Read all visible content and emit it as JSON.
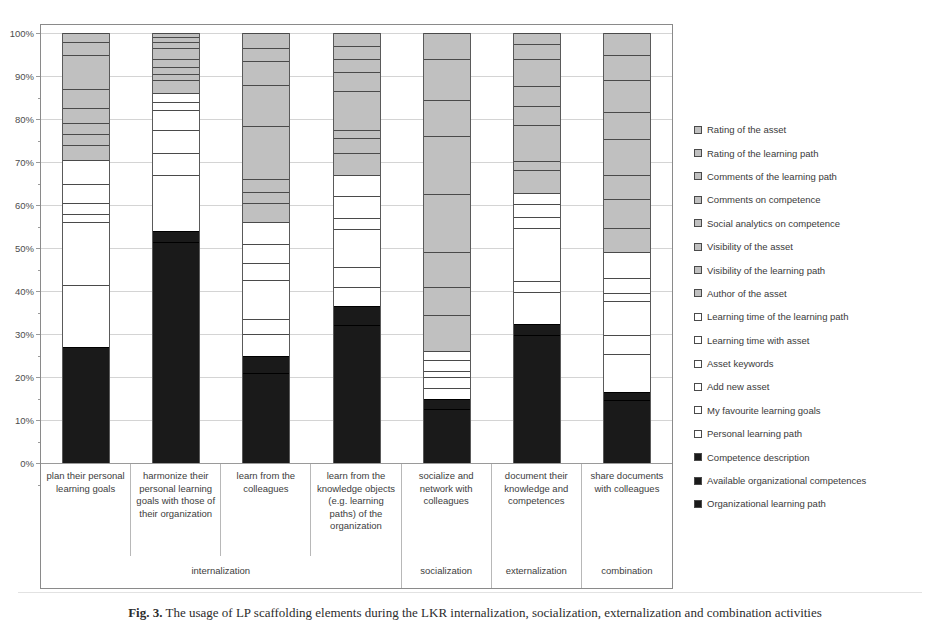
{
  "figure": {
    "caption_label": "Fig. 3.",
    "caption_text": "The usage of LP scaffolding elements during the LKR internalization, socialization, externalization and combination activities"
  },
  "chart_data": {
    "type": "bar",
    "stacked": true,
    "normalized": true,
    "title": "",
    "xlabel": "",
    "ylabel": "",
    "ylim": [
      0,
      100
    ],
    "yticks": [
      "0%",
      "10%",
      "20%",
      "30%",
      "40%",
      "50%",
      "60%",
      "70%",
      "80%",
      "90%",
      "100%"
    ],
    "grid": true,
    "legend_position": "right",
    "categories": [
      "plan their personal learning goals",
      "harmonize their personal learning goals with those of their organization",
      "learn from the colleagues",
      "learn from the knowledge objects (e.g. learning paths) of the organization",
      "socialize and network with colleagues",
      "document their knowledge and competences",
      "share documents with colleagues"
    ],
    "groups": [
      {
        "label": "internalization",
        "span": 4
      },
      {
        "label": "socialization",
        "span": 1
      },
      {
        "label": "externalization",
        "span": 1
      },
      {
        "label": "combination",
        "span": 1
      }
    ],
    "series": [
      {
        "name": "Organizational learning path",
        "fill": "dark",
        "values": [
          17.0,
          30.0,
          12.5,
          10.0,
          7.5,
          19.5,
          9.5
        ]
      },
      {
        "name": "Available organizational competences",
        "fill": "dark",
        "values": [
          10.0,
          21.5,
          8.5,
          22.0,
          5.0,
          10.5,
          6.0
        ]
      },
      {
        "name": "Competence description",
        "fill": "dark",
        "values": [
          0.0,
          2.5,
          4.0,
          4.5,
          2.5,
          2.5,
          2.0
        ]
      },
      {
        "name": "Personal learning path",
        "fill": "white",
        "values": [
          14.5,
          13.0,
          5.0,
          4.5,
          2.5,
          7.5,
          9.5
        ]
      },
      {
        "name": "My favourite learning goals",
        "fill": "white",
        "values": [
          14.5,
          5.0,
          3.5,
          4.5,
          2.5,
          2.5,
          4.5
        ]
      },
      {
        "name": "Add new asset",
        "fill": "white",
        "values": [
          2.0,
          5.5,
          9.0,
          9.0,
          0.0,
          12.5,
          8.5
        ]
      },
      {
        "name": "Asset keywords",
        "fill": "white",
        "values": [
          2.5,
          4.5,
          4.0,
          2.5,
          1.5,
          2.5,
          2.0
        ]
      },
      {
        "name": "Learning time with asset",
        "fill": "white",
        "values": [
          4.5,
          2.0,
          4.5,
          5.0,
          2.5,
          3.0,
          3.5
        ]
      },
      {
        "name": "Learning time of the learning path",
        "fill": "white",
        "values": [
          5.5,
          2.0,
          5.0,
          5.0,
          2.0,
          2.5,
          6.5
        ]
      },
      {
        "name": "Author of the asset",
        "fill": "gray",
        "values": [
          3.5,
          3.0,
          4.5,
          5.0,
          8.5,
          5.5,
          6.0
        ]
      },
      {
        "name": "Visibility of the learning path",
        "fill": "gray",
        "values": [
          2.5,
          1.5,
          2.5,
          3.5,
          6.5,
          2.0,
          7.0
        ]
      },
      {
        "name": "Visibility of the asset",
        "fill": "gray",
        "values": [
          2.5,
          1.5,
          3.0,
          2.0,
          8.0,
          8.5,
          6.0
        ]
      },
      {
        "name": "Social analytics on competence",
        "fill": "gray",
        "values": [
          3.5,
          2.0,
          12.5,
          9.0,
          13.5,
          4.5,
          9.0
        ]
      },
      {
        "name": "Comments on competence",
        "fill": "gray",
        "values": [
          4.5,
          2.5,
          9.5,
          4.5,
          13.5,
          4.5,
          6.5
        ]
      },
      {
        "name": "Comments of the learning path",
        "fill": "gray",
        "values": [
          8.0,
          1.5,
          5.5,
          3.0,
          8.5,
          6.5,
          8.0
        ]
      },
      {
        "name": "Rating of the learning path",
        "fill": "gray",
        "values": [
          3.0,
          1.0,
          3.0,
          3.0,
          9.5,
          3.5,
          6.0
        ]
      },
      {
        "name": "Rating of the asset",
        "fill": "gray",
        "values": [
          2.0,
          1.0,
          3.5,
          3.0,
          6.0,
          2.5,
          5.5
        ]
      }
    ]
  },
  "legend": {
    "items": [
      {
        "label": "Rating of the asset",
        "fill": "gray"
      },
      {
        "label": "Rating of the learning path",
        "fill": "gray"
      },
      {
        "label": "Comments of the learning path",
        "fill": "gray"
      },
      {
        "label": "Comments on competence",
        "fill": "gray"
      },
      {
        "label": "Social analytics on competence",
        "fill": "gray"
      },
      {
        "label": "Visibility of the asset",
        "fill": "gray"
      },
      {
        "label": "Visibility of the learning path",
        "fill": "gray"
      },
      {
        "label": "Author of the asset",
        "fill": "gray"
      },
      {
        "label": "Learning time of the learning path",
        "fill": "white"
      },
      {
        "label": "Learning time with asset",
        "fill": "white"
      },
      {
        "label": "Asset keywords",
        "fill": "white"
      },
      {
        "label": "Add new asset",
        "fill": "white"
      },
      {
        "label": "My favourite learning goals",
        "fill": "white"
      },
      {
        "label": "Personal learning path",
        "fill": "white"
      },
      {
        "label": "Competence description",
        "fill": "dark"
      },
      {
        "label": "Available organizational competences",
        "fill": "dark"
      },
      {
        "label": "Organizational learning path",
        "fill": "dark"
      }
    ]
  },
  "colors": {
    "gray": "#c0c0c0",
    "white": "#ffffff",
    "dark": "#1a1a1a",
    "gridline": "#d4d4d4",
    "axis": "#9a9a9a",
    "segment_border": "#4a4a4a",
    "text": "#3a3a3a"
  }
}
